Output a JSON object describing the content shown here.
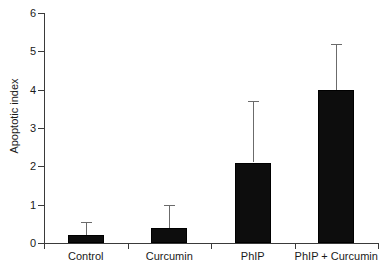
{
  "chart_data": {
    "type": "bar",
    "title": "",
    "xlabel": "",
    "ylabel": "Apoptotic index",
    "categories": [
      "Control",
      "Curcumin",
      "PhIP",
      "PhIP + Curcumin"
    ],
    "values": [
      0.2,
      0.4,
      2.1,
      4.0
    ],
    "errors_upper": [
      0.55,
      1.0,
      3.7,
      5.2
    ],
    "ylim": [
      0,
      6
    ],
    "yticks": [
      0,
      1,
      2,
      3,
      4,
      5,
      6
    ],
    "ytick_labels": [
      "0",
      "1",
      "2",
      "3",
      "4",
      "5",
      "6"
    ],
    "grid": false,
    "legend": null,
    "bar_color": "#0d0d0d",
    "errorbar_color": "#6b6b6b",
    "axis_color": "#3a3a3a",
    "background": "#ffffff"
  }
}
